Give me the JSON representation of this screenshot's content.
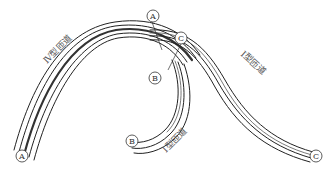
{
  "diagram": {
    "ramps": [
      {
        "id": "ramp-iv",
        "label": "Ⅳ型匝道"
      },
      {
        "id": "ramp-i-main",
        "label": "Ⅰ型匝道"
      },
      {
        "id": "ramp-i-loop",
        "label": "Ⅰ型匝道"
      }
    ],
    "markers": [
      {
        "id": "A-top",
        "text": "A"
      },
      {
        "id": "C-top",
        "text": "C"
      },
      {
        "id": "B-mid",
        "text": "B"
      },
      {
        "id": "B-end",
        "text": "B"
      },
      {
        "id": "A-end",
        "text": "A"
      },
      {
        "id": "C-end",
        "text": "C"
      }
    ],
    "colors": {
      "line": "#222222",
      "dark_band": "#333333",
      "text": "#555555",
      "background": "#ffffff"
    }
  }
}
